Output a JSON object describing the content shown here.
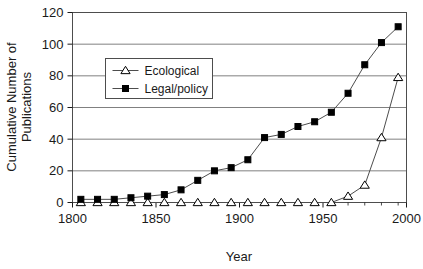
{
  "chart_data": {
    "type": "line",
    "title": "",
    "xlabel": "Year",
    "ylabel": "Cumulative Number of Publications",
    "ylabel_line1": "Cumulative Number of",
    "ylabel_line2": "Publications",
    "xlim": [
      1800,
      2000
    ],
    "ylim": [
      0,
      120
    ],
    "xticks": [
      1800,
      1850,
      1900,
      1950,
      2000
    ],
    "xtick_labels": [
      "1800",
      "1850",
      "1900",
      "1950",
      "2000"
    ],
    "yticks": [
      0,
      20,
      40,
      60,
      80,
      100,
      120
    ],
    "ytick_labels": [
      "0",
      "20",
      "40",
      "60",
      "80",
      "100",
      "120"
    ],
    "grid": "horizontal",
    "legend_position": "upper-left-inside",
    "x": [
      1805,
      1815,
      1825,
      1835,
      1845,
      1855,
      1865,
      1875,
      1885,
      1895,
      1905,
      1915,
      1925,
      1935,
      1945,
      1955,
      1965,
      1975,
      1985,
      1995
    ],
    "series": [
      {
        "name": "Ecological",
        "marker": "open-triangle",
        "color": "#000000",
        "values": [
          0,
          0,
          0,
          0,
          0,
          0,
          0,
          0,
          0,
          0,
          0,
          0,
          0,
          0,
          0,
          0,
          4,
          11,
          41,
          79
        ]
      },
      {
        "name": "Legal/policy",
        "marker": "filled-square",
        "color": "#000000",
        "values": [
          2,
          2,
          2,
          3,
          4,
          5,
          8,
          14,
          20,
          22,
          27,
          41,
          43,
          48,
          51,
          57,
          69,
          87,
          101,
          111
        ]
      }
    ]
  },
  "legend": {
    "entries": [
      {
        "label": "Ecological",
        "marker": "open-triangle"
      },
      {
        "label": "Legal/policy",
        "marker": "filled-square"
      }
    ]
  },
  "colors": {
    "plot_line": "#4d4d4d",
    "gridline": "#808080",
    "axis": "#1a1a1a",
    "marker_fill": "#000000",
    "background": "#ffffff"
  }
}
